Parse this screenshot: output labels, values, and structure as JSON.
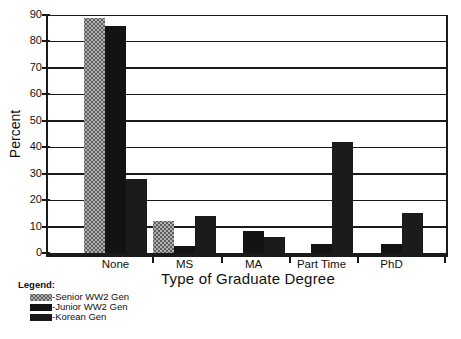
{
  "chart_data": {
    "type": "bar",
    "title": "",
    "xlabel": "Type of Graduate Degree",
    "ylabel": "Percent",
    "categories": [
      "None",
      "MS",
      "MA",
      "Part Time",
      "PhD"
    ],
    "series": [
      {
        "name": "Senior WW2 Gen",
        "pattern": "halftone",
        "color": "#b0b0b0",
        "dot_color": "#5f5f5f",
        "values": [
          89,
          12,
          0,
          0,
          0
        ]
      },
      {
        "name": "Junior WW2 Gen",
        "pattern": "solid",
        "color": "#131313",
        "values": [
          86,
          2.5,
          8.5,
          3.5,
          3.5
        ]
      },
      {
        "name": "Korean Gen",
        "pattern": "solid",
        "color": "#1b1b1b",
        "values": [
          28,
          14,
          6,
          42,
          15
        ]
      }
    ],
    "ylim": [
      0,
      90
    ],
    "yticks": [
      0,
      10,
      20,
      30,
      40,
      50,
      60,
      70,
      80,
      90
    ],
    "grid": true,
    "legend_position": "bottom-left",
    "axis_color": "#1a1a1a"
  },
  "legend": {
    "title": "Legend:",
    "items": [
      {
        "label": "-Senior WW2 Gen"
      },
      {
        "label": "-Junior WW2 Gen"
      },
      {
        "label": "-Korean Gen"
      }
    ]
  }
}
